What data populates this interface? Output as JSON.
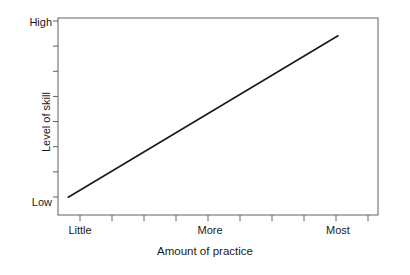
{
  "chart_data": {
    "type": "line",
    "title": "",
    "xlabel": "Amount of practice",
    "ylabel": "Level of skill",
    "x_tick_labels": [
      "Little",
      "More",
      "Most"
    ],
    "y_tick_labels": [
      "High",
      "Low"
    ],
    "x_tick_label_positions": [
      1,
      5,
      9
    ],
    "xlim": [
      0,
      10
    ],
    "ylim": [
      0,
      10
    ],
    "grid": false,
    "legend": null,
    "series": [
      {
        "name": "skill vs practice",
        "color": "#1a1a1a",
        "x": [
          0.32,
          8.75
        ],
        "y": [
          0.9,
          9.1
        ],
        "description": "straight ascending line from low skill at little practice to high skill at most practice"
      }
    ],
    "axis": {
      "frame": true,
      "frame_color": "#555555",
      "x_major_tick_count": 10,
      "y_major_tick_count": 8,
      "ticks_direction": "outward"
    }
  },
  "labels": {
    "y_high": "High",
    "y_low": "Low",
    "x_little": "Little",
    "x_more": "More",
    "x_most": "Most",
    "x_axis_title": "Amount of practice",
    "y_axis_title": "Level of skill"
  }
}
